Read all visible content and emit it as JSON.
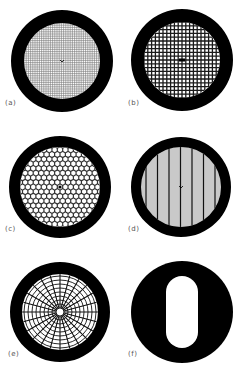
{
  "figure": {
    "panels": [
      {
        "id": "a",
        "label": "(a)",
        "pattern": "fine-square-mesh",
        "cx": 62,
        "cy": 61,
        "r_outer": 51,
        "r_inner": 38,
        "label_x": 5,
        "label_y": 103
      },
      {
        "id": "b",
        "label": "(b)",
        "pattern": "coarse-square-mesh",
        "cx": 182,
        "cy": 60,
        "r_outer": 51,
        "r_inner": 38,
        "label_x": 128,
        "label_y": 102
      },
      {
        "id": "c",
        "label": "(c)",
        "pattern": "hexagonal-mesh",
        "cx": 60,
        "cy": 187,
        "r_outer": 51,
        "r_inner": 40,
        "label_x": 5,
        "label_y": 228
      },
      {
        "id": "d",
        "label": "(d)",
        "pattern": "parallel-bar-mesh",
        "cx": 181,
        "cy": 187,
        "r_outer": 50,
        "r_inner": 40,
        "label_x": 128,
        "label_y": 228
      },
      {
        "id": "e",
        "label": "(e)",
        "pattern": "radial-polar-mesh",
        "cx": 60,
        "cy": 312,
        "r_outer": 50,
        "r_inner": 38,
        "label_x": 8,
        "label_y": 354
      },
      {
        "id": "f",
        "label": "(f)",
        "pattern": "single-slot-aperture",
        "cx": 182,
        "cy": 312,
        "r_outer": 51,
        "r_inner": 0,
        "label_x": 128,
        "label_y": 354
      }
    ],
    "colors": {
      "rim": "#000000",
      "mesh": "#1a1a1a",
      "background": "#ffffff"
    }
  }
}
